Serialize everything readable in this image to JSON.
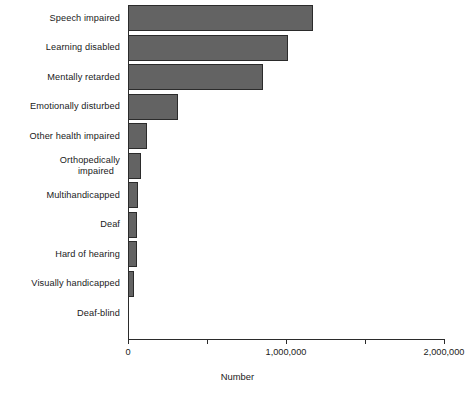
{
  "chart_data": {
    "type": "bar",
    "orientation": "horizontal",
    "title": "",
    "xlabel": "Number",
    "ylabel": "",
    "xlim": [
      0,
      2000000
    ],
    "grid": false,
    "legend": null,
    "xticks": [
      {
        "value": 0,
        "label": "0",
        "major": true
      },
      {
        "value": 500000,
        "label": "",
        "major": false
      },
      {
        "value": 1000000,
        "label": "1,000,000",
        "major": true
      },
      {
        "value": 1500000,
        "label": "",
        "major": false
      },
      {
        "value": 2000000,
        "label": "2,000,000",
        "major": true
      }
    ],
    "categories": [
      "Speech impaired",
      "Learning disabled",
      "Mentally retarded",
      "Emotionally disturbed",
      "Other health impaired",
      "Orthopedically impaired",
      "Multihandicapped",
      "Deaf",
      "Hard of hearing",
      "Visually handicapped",
      "Deaf-blind"
    ],
    "category_lines": [
      [
        "Speech impaired"
      ],
      [
        "Learning disabled"
      ],
      [
        "Mentally retarded"
      ],
      [
        "Emotionally disturbed"
      ],
      [
        "Other health impaired"
      ],
      [
        "Orthopedically",
        "impaired"
      ],
      [
        "Multihandicapped"
      ],
      [
        "Deaf"
      ],
      [
        "Hard of hearing"
      ],
      [
        "Visually handicapped"
      ],
      [
        "Deaf-blind"
      ]
    ],
    "values": [
      1170000,
      1010000,
      855000,
      315000,
      120000,
      82000,
      65000,
      58000,
      55000,
      38000,
      0
    ],
    "bar_color": "#636363",
    "bar_edge_color": "#2b2b2b",
    "axis_color": "#2b2b2b",
    "background": "#ffffff"
  }
}
